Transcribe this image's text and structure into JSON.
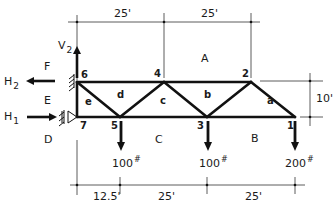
{
  "diagram": {
    "type": "truss",
    "colors": {
      "member": "#111111",
      "dimension": "#333333",
      "text": "#1a1a1a",
      "background": "#ffffff"
    },
    "dimensions": {
      "top": [
        "25'",
        "25'"
      ],
      "bottom": [
        "12.5'",
        "25'",
        "25'"
      ],
      "height": "10'"
    },
    "nodes": [
      "1",
      "2",
      "3",
      "4",
      "5",
      "6",
      "7"
    ],
    "space_labels": {
      "A": "A",
      "B": "B",
      "C": "C",
      "D": "D",
      "E": "E",
      "F": "F"
    },
    "panel_labels": {
      "a": "a",
      "b": "b",
      "c": "c",
      "d": "d",
      "e": "e"
    },
    "loads": [
      {
        "node": "5",
        "value": "100",
        "unit": "#"
      },
      {
        "node": "3",
        "value": "100",
        "unit": "#"
      },
      {
        "node": "1",
        "value": "200",
        "unit": "#"
      }
    ],
    "reactions": {
      "v2": {
        "base": "V",
        "sub": "2"
      },
      "h2": {
        "base": "H",
        "sub": "2"
      },
      "h1": {
        "base": "H",
        "sub": "1"
      }
    }
  }
}
